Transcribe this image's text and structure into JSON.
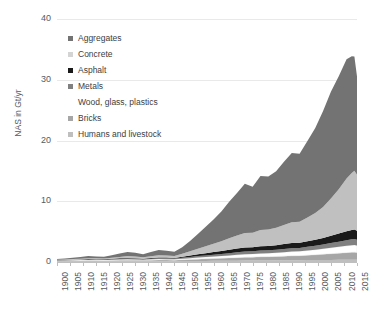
{
  "chart_data": {
    "type": "area",
    "title": "",
    "subtitle": "",
    "xlabel": "",
    "ylabel": "NAS in Gt/yr",
    "xlim": [
      1900,
      2015
    ],
    "ylim": [
      0,
      40
    ],
    "grid": true,
    "stacked": true,
    "legend_position": "upper-left-inside",
    "ytick_labels": [
      "0",
      "10",
      "20",
      "30",
      "40"
    ],
    "ytick_values": [
      0,
      10,
      20,
      30,
      40
    ],
    "xtick_labels": [
      "1900",
      "1905",
      "1910",
      "1915",
      "1920",
      "1925",
      "1930",
      "1935",
      "1940",
      "1945",
      "1950",
      "1955",
      "1960",
      "1965",
      "1970",
      "1975",
      "1980",
      "1985",
      "1990",
      "1995",
      "2000",
      "2005",
      "2010",
      "2015"
    ],
    "x": [
      1900,
      1903,
      1906,
      1909,
      1912,
      1915,
      1918,
      1921,
      1924,
      1927,
      1930,
      1933,
      1936,
      1939,
      1942,
      1945,
      1948,
      1951,
      1954,
      1957,
      1960,
      1963,
      1966,
      1969,
      1972,
      1975,
      1978,
      1981,
      1984,
      1987,
      1990,
      1993,
      1996,
      1999,
      2002,
      2005,
      2008,
      2011,
      2013,
      2014,
      2015
    ],
    "series": [
      {
        "name": "Humans and livestock",
        "color": "#bfbfbf",
        "values": [
          0.08,
          0.08,
          0.09,
          0.09,
          0.1,
          0.1,
          0.1,
          0.11,
          0.11,
          0.12,
          0.12,
          0.12,
          0.13,
          0.13,
          0.14,
          0.14,
          0.15,
          0.16,
          0.17,
          0.18,
          0.19,
          0.2,
          0.21,
          0.22,
          0.23,
          0.24,
          0.25,
          0.26,
          0.27,
          0.28,
          0.29,
          0.3,
          0.31,
          0.32,
          0.33,
          0.34,
          0.35,
          0.36,
          0.37,
          0.37,
          0.37
        ]
      },
      {
        "name": "Bricks",
        "color": "#a6a6a6",
        "values": [
          0.1,
          0.11,
          0.12,
          0.13,
          0.14,
          0.13,
          0.12,
          0.14,
          0.16,
          0.18,
          0.17,
          0.15,
          0.17,
          0.19,
          0.17,
          0.16,
          0.2,
          0.25,
          0.3,
          0.34,
          0.38,
          0.42,
          0.46,
          0.5,
          0.54,
          0.56,
          0.6,
          0.62,
          0.64,
          0.68,
          0.72,
          0.74,
          0.8,
          0.86,
          0.94,
          1.02,
          1.1,
          1.18,
          1.22,
          1.24,
          1.2
        ]
      },
      {
        "name": "Wood, glass, plastics",
        "color": "#ffffff",
        "values": [
          0.06,
          0.07,
          0.08,
          0.09,
          0.1,
          0.1,
          0.1,
          0.11,
          0.13,
          0.14,
          0.13,
          0.12,
          0.14,
          0.16,
          0.15,
          0.14,
          0.18,
          0.22,
          0.26,
          0.3,
          0.34,
          0.38,
          0.42,
          0.46,
          0.5,
          0.52,
          0.56,
          0.58,
          0.62,
          0.66,
          0.7,
          0.72,
          0.78,
          0.84,
          0.9,
          0.98,
          1.04,
          1.12,
          1.16,
          1.18,
          1.14
        ]
      },
      {
        "name": "Metals",
        "color": "#808080",
        "values": [
          0.05,
          0.06,
          0.07,
          0.08,
          0.09,
          0.08,
          0.07,
          0.09,
          0.11,
          0.12,
          0.1,
          0.08,
          0.11,
          0.14,
          0.15,
          0.12,
          0.16,
          0.2,
          0.24,
          0.27,
          0.3,
          0.33,
          0.37,
          0.41,
          0.44,
          0.44,
          0.48,
          0.49,
          0.5,
          0.53,
          0.56,
          0.56,
          0.6,
          0.64,
          0.7,
          0.78,
          0.86,
          0.94,
          0.98,
          1.0,
          0.96
        ]
      },
      {
        "name": "Asphalt",
        "color": "#1a1a1a",
        "values": [
          0.02,
          0.02,
          0.03,
          0.04,
          0.05,
          0.05,
          0.05,
          0.07,
          0.09,
          0.11,
          0.1,
          0.08,
          0.11,
          0.13,
          0.12,
          0.11,
          0.17,
          0.24,
          0.3,
          0.36,
          0.42,
          0.48,
          0.56,
          0.62,
          0.68,
          0.66,
          0.72,
          0.7,
          0.74,
          0.8,
          0.86,
          0.84,
          0.92,
          1.0,
          1.1,
          1.22,
          1.34,
          1.46,
          1.52,
          1.54,
          1.48
        ]
      },
      {
        "name": "Concrete",
        "color": "#c0c0c0",
        "values": [
          0.05,
          0.07,
          0.09,
          0.12,
          0.15,
          0.14,
          0.13,
          0.18,
          0.24,
          0.3,
          0.27,
          0.22,
          0.3,
          0.38,
          0.34,
          0.3,
          0.48,
          0.7,
          0.92,
          1.14,
          1.36,
          1.6,
          1.88,
          2.14,
          2.4,
          2.38,
          2.66,
          2.72,
          2.86,
          3.14,
          3.4,
          3.46,
          3.9,
          4.4,
          5.1,
          6.1,
          7.3,
          8.7,
          9.4,
          9.7,
          9.2
        ]
      },
      {
        "name": "Aggregates",
        "color": "#737373",
        "values": [
          0.12,
          0.16,
          0.21,
          0.27,
          0.34,
          0.32,
          0.3,
          0.41,
          0.55,
          0.68,
          0.62,
          0.5,
          0.68,
          0.86,
          0.78,
          0.7,
          1.1,
          1.7,
          2.4,
          3.2,
          4.0,
          4.9,
          6.0,
          7.0,
          8.1,
          7.6,
          8.9,
          8.7,
          9.3,
          10.4,
          11.4,
          11.2,
          12.6,
          14.0,
          15.8,
          17.6,
          18.6,
          19.6,
          19.2,
          18.8,
          16.2
        ]
      }
    ],
    "peak": {
      "year": 2014,
      "total": 32.0
    }
  },
  "legend": {
    "items": [
      {
        "label": "Aggregates",
        "swatch": "#737373",
        "has_swatch": true
      },
      {
        "label": "Concrete",
        "swatch": "#d4d4d4",
        "has_swatch": true
      },
      {
        "label": "Asphalt",
        "swatch": "#1a1a1a",
        "has_swatch": true
      },
      {
        "label": "Metals",
        "swatch": "#808080",
        "has_swatch": true
      },
      {
        "label": "Wood, glass, plastics",
        "swatch": "#ffffff",
        "has_swatch": false
      },
      {
        "label": "Bricks",
        "swatch": "#a6a6a6",
        "has_swatch": true
      },
      {
        "label": "Humans and livestock",
        "swatch": "#bfbfbf",
        "has_swatch": true
      }
    ]
  },
  "axis": {
    "y_title": "NAS in Gt/yr"
  }
}
